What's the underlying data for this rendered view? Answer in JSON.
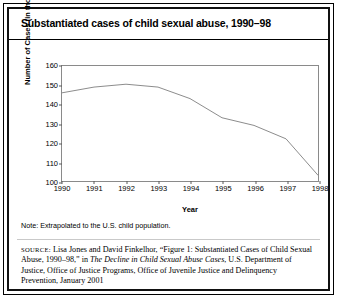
{
  "title": "Substantiated cases of child sexual abuse, 1990–98",
  "note": "Note: Extrapolated to the U.S. child population.",
  "source": {
    "label": "SOURCE:",
    "part1": " Lisa Jones and David Finkelhor, “Figure 1: Substantiated Cases of Child Sexual Abuse, 1990–98,” in ",
    "italic1": "The Decline in Child Sexual Abuse Cases",
    "part2": ", U.S. Department of Justice, Office of Justice Programs, Office of Juvenile Justice and Delinquency Prevention, January 2001"
  },
  "chart_data": {
    "type": "line",
    "title": "Substantiated cases of child sexual abuse, 1990–98",
    "xlabel": "Year",
    "ylabel": "Number of Cases (in thousands)",
    "categories": [
      "1990",
      "1991",
      "1992",
      "1993",
      "1994",
      "1995",
      "1996",
      "1997",
      "1998"
    ],
    "values": [
      146,
      149,
      150.5,
      149,
      143,
      133,
      129,
      122,
      103
    ],
    "series": [
      {
        "name": "Substantiated cases (thousands)",
        "values": [
          146,
          149,
          150.5,
          149,
          143,
          133,
          129,
          122,
          103
        ]
      }
    ],
    "xlim": [
      1990,
      1998
    ],
    "ylim": [
      100,
      160
    ],
    "yticks": [
      100,
      110,
      120,
      130,
      140,
      150,
      160
    ],
    "xticks": [
      "1990",
      "1991",
      "1992",
      "1993",
      "1994",
      "1995",
      "1996",
      "1997",
      "1998"
    ],
    "grid": false,
    "legend": "none",
    "line_color": "#8a8a8a"
  }
}
